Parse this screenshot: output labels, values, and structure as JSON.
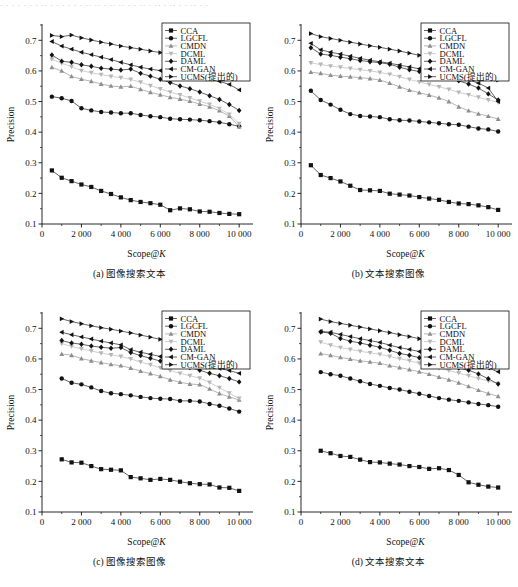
{
  "figure": {
    "top_cut_text": "· · ·   · · · ·   ·· · · ·  · · ·  ·· ·· ·  ·· ·· ·  · ·· · ·· ·   ·· · ·  ·· · ·",
    "axis": {
      "ylabel": "Precision",
      "xlabel_main": "Scope@",
      "xlabel_italic": "K",
      "yticks": [
        "0.1",
        "0.2",
        "0.3",
        "0.4",
        "0.5",
        "0.6",
        "0.7"
      ],
      "ytick_values": [
        0.1,
        0.2,
        0.3,
        0.4,
        0.5,
        0.6,
        0.7
      ],
      "xticks": [
        "0",
        "2 000",
        "4 000",
        "6 000",
        "8 000",
        "10 000"
      ],
      "xtick_values": [
        0,
        2000,
        4000,
        6000,
        8000,
        10000
      ],
      "xlim": [
        0,
        10600
      ],
      "ylim": [
        0.1,
        0.75
      ]
    },
    "legend": {
      "position": "top-right",
      "entries": [
        {
          "label": "CCA",
          "marker": "square",
          "color": "#111111"
        },
        {
          "label": "LGCFL",
          "marker": "circle",
          "color": "#111111"
        },
        {
          "label": "CMDN",
          "marker": "triangle-up",
          "color": "#8e8e8e"
        },
        {
          "label": "DCML",
          "marker": "triangle-down",
          "color": "#b6b6b6"
        },
        {
          "label": "DAML",
          "marker": "diamond",
          "color": "#111111"
        },
        {
          "label": "CM-GAN",
          "marker": "triangle-left",
          "color": "#111111"
        },
        {
          "label": "UCMS(提出的)",
          "marker": "triangle-right",
          "color": "#111111"
        }
      ]
    }
  },
  "chart_data": [
    {
      "id": "a",
      "type": "line",
      "title": "(a) 图像搜索文本",
      "xlabel": "Scope@K",
      "ylabel": "Precision",
      "xlim": [
        0,
        10600
      ],
      "ylim": [
        0.1,
        0.75
      ],
      "grid": false,
      "legend_position": "top-right",
      "x": [
        500,
        1000,
        1500,
        2000,
        2500,
        3000,
        3500,
        4000,
        4500,
        5000,
        5500,
        6000,
        6500,
        7000,
        7500,
        8000,
        8500,
        9000,
        9500,
        10000
      ],
      "series": [
        {
          "name": "CCA",
          "marker": "square",
          "color": "#111111",
          "values": [
            0.275,
            0.251,
            0.24,
            0.229,
            0.221,
            0.208,
            0.198,
            0.187,
            0.178,
            0.172,
            0.168,
            0.163,
            0.145,
            0.151,
            0.148,
            0.141,
            0.14,
            0.136,
            0.133,
            0.132
          ]
        },
        {
          "name": "LGCFL",
          "marker": "circle",
          "color": "#111111",
          "values": [
            0.516,
            0.511,
            0.502,
            0.478,
            0.471,
            0.466,
            0.464,
            0.462,
            0.462,
            0.456,
            0.452,
            0.449,
            0.444,
            0.442,
            0.441,
            0.439,
            0.436,
            0.432,
            0.426,
            0.419
          ]
        },
        {
          "name": "CMDN",
          "marker": "triangle-up",
          "color": "#8e8e8e",
          "values": [
            0.612,
            0.6,
            0.582,
            0.573,
            0.566,
            0.557,
            0.551,
            0.548,
            0.55,
            0.54,
            0.53,
            0.522,
            0.514,
            0.508,
            0.501,
            0.492,
            0.483,
            0.47,
            0.452,
            0.418
          ]
        },
        {
          "name": "DCML",
          "marker": "triangle-down",
          "color": "#b6b6b6",
          "values": [
            0.638,
            0.625,
            0.614,
            0.601,
            0.594,
            0.588,
            0.582,
            0.578,
            0.572,
            0.563,
            0.552,
            0.541,
            0.531,
            0.522,
            0.512,
            0.501,
            0.491,
            0.477,
            0.458,
            0.428
          ]
        },
        {
          "name": "DAML",
          "marker": "diamond",
          "color": "#111111",
          "values": [
            0.652,
            0.632,
            0.628,
            0.62,
            0.615,
            0.609,
            0.606,
            0.603,
            0.606,
            0.592,
            0.583,
            0.573,
            0.562,
            0.551,
            0.542,
            0.531,
            0.519,
            0.507,
            0.49,
            0.471
          ]
        },
        {
          "name": "CM-GAN",
          "marker": "triangle-left",
          "color": "#111111",
          "values": [
            0.696,
            0.681,
            0.671,
            0.661,
            0.653,
            0.645,
            0.637,
            0.628,
            0.62,
            0.612,
            0.606,
            0.601,
            0.596,
            0.591,
            0.586,
            0.58,
            0.573,
            0.566,
            0.556,
            0.538
          ]
        },
        {
          "name": "UCMS(提出的)",
          "marker": "triangle-right",
          "color": "#111111",
          "values": [
            0.716,
            0.712,
            0.717,
            0.708,
            0.701,
            0.694,
            0.688,
            0.681,
            0.676,
            0.671,
            0.665,
            0.66,
            0.653,
            0.646,
            0.64,
            0.632,
            0.622,
            0.612,
            0.601,
            0.585
          ]
        }
      ]
    },
    {
      "id": "b",
      "type": "line",
      "title": "(b) 文本搜索图像",
      "xlabel": "Scope@K",
      "ylabel": "Precision",
      "xlim": [
        0,
        10600
      ],
      "ylim": [
        0.1,
        0.75
      ],
      "grid": false,
      "legend_position": "top-right",
      "x": [
        500,
        1000,
        1500,
        2000,
        2500,
        3000,
        3500,
        4000,
        4500,
        5000,
        5500,
        6000,
        6500,
        7000,
        7500,
        8000,
        8500,
        9000,
        9500,
        10000
      ],
      "series": [
        {
          "name": "CCA",
          "marker": "square",
          "color": "#111111",
          "values": [
            0.292,
            0.26,
            0.25,
            0.239,
            0.225,
            0.211,
            0.21,
            0.208,
            0.199,
            0.196,
            0.193,
            0.188,
            0.183,
            0.179,
            0.172,
            0.167,
            0.165,
            0.161,
            0.155,
            0.146
          ]
        },
        {
          "name": "LGCFL",
          "marker": "circle",
          "color": "#111111",
          "values": [
            0.535,
            0.505,
            0.49,
            0.473,
            0.459,
            0.453,
            0.451,
            0.449,
            0.442,
            0.439,
            0.438,
            0.435,
            0.432,
            0.429,
            0.426,
            0.424,
            0.418,
            0.412,
            0.409,
            0.402
          ]
        },
        {
          "name": "CMDN",
          "marker": "triangle-up",
          "color": "#8e8e8e",
          "values": [
            0.596,
            0.592,
            0.586,
            0.583,
            0.581,
            0.578,
            0.575,
            0.57,
            0.56,
            0.548,
            0.537,
            0.529,
            0.521,
            0.512,
            0.5,
            0.483,
            0.47,
            0.46,
            0.452,
            0.443
          ]
        },
        {
          "name": "DCML",
          "marker": "triangle-down",
          "color": "#b6b6b6",
          "values": [
            0.626,
            0.621,
            0.616,
            0.612,
            0.608,
            0.604,
            0.6,
            0.595,
            0.589,
            0.581,
            0.572,
            0.564,
            0.556,
            0.548,
            0.54,
            0.53,
            0.522,
            0.514,
            0.505,
            0.497
          ]
        },
        {
          "name": "DAML",
          "marker": "diamond",
          "color": "#111111",
          "values": [
            0.676,
            0.655,
            0.651,
            0.645,
            0.64,
            0.634,
            0.63,
            0.627,
            0.622,
            0.612,
            0.604,
            0.598,
            0.592,
            0.585,
            0.578,
            0.568,
            0.557,
            0.544,
            0.525,
            0.505
          ]
        },
        {
          "name": "CM-GAN",
          "marker": "triangle-left",
          "color": "#111111",
          "values": [
            0.69,
            0.669,
            0.661,
            0.655,
            0.648,
            0.641,
            0.635,
            0.63,
            0.625,
            0.619,
            0.613,
            0.607,
            0.601,
            0.595,
            0.589,
            0.581,
            0.571,
            0.56,
            0.544,
            0.5
          ]
        },
        {
          "name": "UCMS(提出的)",
          "marker": "triangle-right",
          "color": "#111111",
          "values": [
            0.722,
            0.712,
            0.706,
            0.7,
            0.694,
            0.688,
            0.682,
            0.677,
            0.671,
            0.665,
            0.658,
            0.651,
            0.644,
            0.636,
            0.628,
            0.619,
            0.609,
            0.6,
            0.589,
            0.57
          ]
        }
      ]
    },
    {
      "id": "c",
      "type": "line",
      "title": "(c) 图像搜索图像",
      "xlabel": "Scope@K",
      "ylabel": "Precision",
      "xlim": [
        0,
        10600
      ],
      "ylim": [
        0.1,
        0.75
      ],
      "grid": false,
      "legend_position": "top-right",
      "x": [
        1000,
        1500,
        2000,
        2500,
        3000,
        3500,
        4000,
        4500,
        5000,
        5500,
        6000,
        6500,
        7000,
        7500,
        8000,
        8500,
        9000,
        9500,
        10000
      ],
      "series": [
        {
          "name": "CCA",
          "marker": "square",
          "color": "#111111",
          "values": [
            0.272,
            0.262,
            0.261,
            0.25,
            0.24,
            0.238,
            0.236,
            0.214,
            0.21,
            0.205,
            0.208,
            0.205,
            0.199,
            0.194,
            0.191,
            0.19,
            0.18,
            0.179,
            0.169
          ]
        },
        {
          "name": "LGCFL",
          "marker": "circle",
          "color": "#111111",
          "values": [
            0.536,
            0.522,
            0.517,
            0.507,
            0.495,
            0.488,
            0.485,
            0.481,
            0.476,
            0.472,
            0.47,
            0.469,
            0.463,
            0.463,
            0.461,
            0.453,
            0.447,
            0.438,
            0.428
          ]
        },
        {
          "name": "CMDN",
          "marker": "triangle-up",
          "color": "#8e8e8e",
          "values": [
            0.616,
            0.612,
            0.601,
            0.594,
            0.588,
            0.582,
            0.578,
            0.57,
            0.56,
            0.552,
            0.543,
            0.532,
            0.524,
            0.518,
            0.516,
            0.502,
            0.487,
            0.476,
            0.466
          ]
        },
        {
          "name": "DCML",
          "marker": "triangle-down",
          "color": "#b6b6b6",
          "values": [
            0.65,
            0.641,
            0.633,
            0.626,
            0.619,
            0.613,
            0.608,
            0.6,
            0.59,
            0.581,
            0.571,
            0.562,
            0.553,
            0.545,
            0.537,
            0.523,
            0.506,
            0.488,
            0.471
          ]
        },
        {
          "name": "DAML",
          "marker": "diamond",
          "color": "#111111",
          "values": [
            0.66,
            0.652,
            0.648,
            0.642,
            0.638,
            0.635,
            0.637,
            0.621,
            0.611,
            0.602,
            0.593,
            0.586,
            0.578,
            0.572,
            0.563,
            0.553,
            0.545,
            0.536,
            0.525
          ]
        },
        {
          "name": "CM-GAN",
          "marker": "triangle-left",
          "color": "#111111",
          "values": [
            0.687,
            0.679,
            0.672,
            0.665,
            0.658,
            0.652,
            0.646,
            0.63,
            0.622,
            0.615,
            0.608,
            0.601,
            0.595,
            0.589,
            0.582,
            0.575,
            0.569,
            0.562,
            0.553
          ]
        },
        {
          "name": "UCMS(提出的)",
          "marker": "triangle-right",
          "color": "#111111",
          "values": [
            0.731,
            0.722,
            0.715,
            0.708,
            0.702,
            0.697,
            0.691,
            0.685,
            0.678,
            0.671,
            0.664,
            0.658,
            0.652,
            0.646,
            0.64,
            0.632,
            0.623,
            0.612,
            0.601
          ]
        }
      ]
    },
    {
      "id": "d",
      "type": "line",
      "title": "(d) 文本搜索文本",
      "xlabel": "Scope@K",
      "ylabel": "Precision",
      "xlim": [
        0,
        10600
      ],
      "ylim": [
        0.1,
        0.75
      ],
      "grid": false,
      "legend_position": "top-right",
      "x": [
        1000,
        1500,
        2000,
        2500,
        3000,
        3500,
        4000,
        4500,
        5000,
        5500,
        6000,
        6500,
        7000,
        7500,
        8000,
        8500,
        9000,
        9500,
        10000
      ],
      "series": [
        {
          "name": "CCA",
          "marker": "square",
          "color": "#111111",
          "values": [
            0.3,
            0.292,
            0.283,
            0.28,
            0.271,
            0.263,
            0.262,
            0.258,
            0.255,
            0.25,
            0.247,
            0.241,
            0.243,
            0.237,
            0.221,
            0.197,
            0.189,
            0.183,
            0.18
          ]
        },
        {
          "name": "LGCFL",
          "marker": "circle",
          "color": "#111111",
          "values": [
            0.557,
            0.55,
            0.545,
            0.536,
            0.527,
            0.518,
            0.512,
            0.505,
            0.5,
            0.493,
            0.486,
            0.479,
            0.472,
            0.467,
            0.463,
            0.458,
            0.453,
            0.449,
            0.444
          ]
        },
        {
          "name": "CMDN",
          "marker": "triangle-up",
          "color": "#8e8e8e",
          "values": [
            0.617,
            0.612,
            0.605,
            0.599,
            0.594,
            0.59,
            0.586,
            0.578,
            0.572,
            0.565,
            0.558,
            0.55,
            0.541,
            0.532,
            0.522,
            0.51,
            0.498,
            0.487,
            0.478
          ]
        },
        {
          "name": "DCML",
          "marker": "triangle-down",
          "color": "#b6b6b6",
          "values": [
            0.655,
            0.645,
            0.637,
            0.631,
            0.625,
            0.62,
            0.615,
            0.608,
            0.601,
            0.594,
            0.586,
            0.578,
            0.57,
            0.562,
            0.554,
            0.545,
            0.536,
            0.528,
            0.519
          ]
        },
        {
          "name": "DAML",
          "marker": "diamond",
          "color": "#111111",
          "values": [
            0.688,
            0.684,
            0.667,
            0.658,
            0.652,
            0.645,
            0.638,
            0.628,
            0.618,
            0.612,
            0.604,
            0.595,
            0.586,
            0.578,
            0.57,
            0.563,
            0.551,
            0.535,
            0.518
          ]
        },
        {
          "name": "CM-GAN",
          "marker": "triangle-left",
          "color": "#111111",
          "values": [
            0.69,
            0.687,
            0.68,
            0.673,
            0.666,
            0.66,
            0.654,
            0.645,
            0.637,
            0.631,
            0.624,
            0.616,
            0.608,
            0.601,
            0.593,
            0.586,
            0.578,
            0.57,
            0.558
          ]
        },
        {
          "name": "UCMS(提出的)",
          "marker": "triangle-right",
          "color": "#111111",
          "values": [
            0.73,
            0.722,
            0.716,
            0.71,
            0.704,
            0.698,
            0.692,
            0.686,
            0.679,
            0.673,
            0.666,
            0.659,
            0.652,
            0.645,
            0.637,
            0.628,
            0.618,
            0.608,
            0.597
          ]
        }
      ]
    }
  ]
}
